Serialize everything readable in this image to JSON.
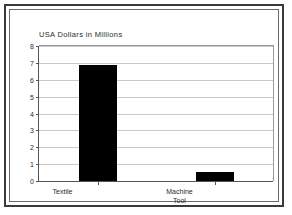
{
  "chart_data": {
    "type": "bar",
    "title": "USA Dollars in Millions",
    "xlabel": "",
    "ylabel": "",
    "categories": [
      "Textile",
      "Machine\nTool"
    ],
    "values": [
      6.9,
      0.55
    ],
    "ylim": [
      0,
      8
    ],
    "yticks": [
      0,
      1,
      2,
      3,
      4,
      5,
      6,
      7,
      8
    ],
    "ytick_labels": [
      "0",
      "1",
      "2",
      "3",
      "4",
      "5",
      "6",
      "7",
      "8"
    ],
    "grid": "horizontal",
    "legend": "none",
    "bar_color": "#000000",
    "grid_color": "#c9c9c9",
    "axis_color": "#555555",
    "background_color": "#ffffff",
    "frame_color": "#3a3a3a"
  }
}
